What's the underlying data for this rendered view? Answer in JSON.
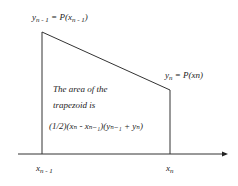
{
  "diagram": {
    "top_left_label": {
      "y": "y",
      "y_sub": "n - 1",
      "eq": " = P(x",
      "x_sub": "n - 1",
      "close": ")"
    },
    "top_right_label": {
      "y": "y",
      "y_sub": "n",
      "rest": " = P(xn)"
    },
    "area_text": {
      "line1": "The area of the",
      "line2": "trapezoid is",
      "formula": "(1/2)(xₙ - xₙ₋₁)(yₙ₋₁ + yₙ)"
    },
    "x_labels": {
      "left": {
        "x": "x",
        "sub": "n - 1"
      },
      "right": {
        "x": "x",
        "sub": "n"
      }
    },
    "colors": {
      "line": "#333333",
      "text": "#222222",
      "background": "#ffffff"
    }
  }
}
